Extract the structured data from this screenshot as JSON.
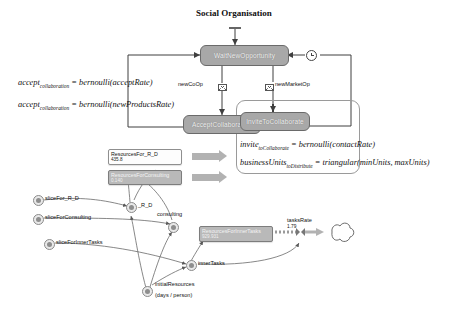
{
  "diagram": {
    "title": "Social Organisation",
    "states": [
      {
        "id": "wait",
        "label": "WaitNewOpportunity"
      },
      {
        "id": "accept",
        "label": "AcceptCollaboration"
      },
      {
        "id": "invite",
        "label": "InviteToCollaborate"
      }
    ],
    "messages": [
      {
        "id": "newCoOp",
        "label": "newCoOp",
        "icon": "envelope-icon"
      },
      {
        "id": "newMarketOp",
        "label": "newMarketOp",
        "icon": "envelope-icon"
      }
    ],
    "timer": {
      "icon": "clock-icon"
    },
    "formulas_left": [
      {
        "name": "accept",
        "sub": "collaboration",
        "expr": "= bernoulli(acceptRate)"
      },
      {
        "name": "accept",
        "sub": "collaboration",
        "expr": "= bernoulli(newProductsRate)"
      }
    ],
    "formulas_right": [
      {
        "name": "invite",
        "sub": "toCollaborate",
        "expr": "= bernoulli(contactRate)"
      },
      {
        "name": "businessUnits",
        "sub": "toDistribute",
        "expr": "= triangular(minUnits, maxUnits)"
      }
    ],
    "stocks": [
      {
        "id": "rrd",
        "label": "ResourcesFor_R_D",
        "value": "435.8"
      },
      {
        "id": "rcons",
        "label": "ResourcesForConsulting",
        "value": "0.140"
      },
      {
        "id": "rinner",
        "label": "ResourcesForInnerTasks",
        "value": "929.931"
      }
    ],
    "variables": [
      {
        "id": "sliceRD",
        "label": "sliceFor_R_D"
      },
      {
        "id": "sliceCons",
        "label": "sliceForConsulting"
      },
      {
        "id": "sliceInner",
        "label": "sliceForInnerTasks"
      },
      {
        "id": "rd",
        "label": "_R_D"
      },
      {
        "id": "consulting",
        "label": "consulting"
      },
      {
        "id": "innerTasks",
        "label": "innerTasks"
      },
      {
        "id": "initRes",
        "label": "initialResources"
      }
    ],
    "annotations": [
      {
        "id": "initResUnits",
        "label": "(days / person)"
      }
    ],
    "rates": [
      {
        "id": "tasksRate",
        "label": "tasksRate",
        "value": "1.79"
      }
    ],
    "sink": {
      "id": "sink",
      "icon": "cloud-sink-icon"
    },
    "colors": {
      "state_fill": "#a8a8a8",
      "state_stroke": "#6a6a6a",
      "flow_arrow": "#b2b2b2",
      "stock_filled": "#b9b9b9",
      "line": "#4a4a4a"
    }
  }
}
